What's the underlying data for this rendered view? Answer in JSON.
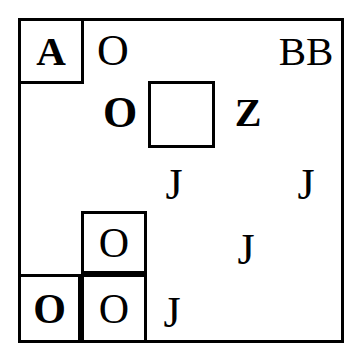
{
  "canvas": {
    "width": 362,
    "height": 362,
    "background": "#ffffff",
    "ink": "#000000"
  },
  "outer_frame": {
    "name": "outer-frame",
    "x": 18,
    "y": 18,
    "w": 326,
    "h": 325,
    "stroke": "#000000",
    "stroke_width": 3
  },
  "boxes": [
    {
      "name": "box-top-left-a",
      "x": 18,
      "y": 18,
      "w": 66,
      "h": 66
    },
    {
      "name": "box-center-empty",
      "x": 148,
      "y": 81,
      "w": 67,
      "h": 67
    },
    {
      "name": "box-lower-middle-o",
      "x": 81,
      "y": 211,
      "w": 66,
      "h": 63
    },
    {
      "name": "box-bottom-left-o",
      "x": 18,
      "y": 274,
      "w": 63,
      "h": 69
    },
    {
      "name": "box-bottom-middle-o",
      "x": 81,
      "y": 274,
      "w": 66,
      "h": 69
    }
  ],
  "glyphs": [
    {
      "name": "glyph-a-boxed",
      "text": "A",
      "x": 18,
      "y": 18,
      "w": 66,
      "h": 66,
      "size": 41,
      "weight": "bold"
    },
    {
      "name": "glyph-o-top",
      "text": "O",
      "x": 88,
      "y": 26,
      "w": 50,
      "h": 50,
      "size": 44,
      "weight": "regular"
    },
    {
      "name": "glyph-bb-top-right",
      "text": "BB",
      "x": 272,
      "y": 26,
      "w": 68,
      "h": 50,
      "size": 41,
      "weight": "regular"
    },
    {
      "name": "glyph-o-bold-middle",
      "text": "O",
      "x": 95,
      "y": 88,
      "w": 50,
      "h": 50,
      "size": 44,
      "weight": "bold"
    },
    {
      "name": "glyph-z-bold",
      "text": "Z",
      "x": 224,
      "y": 90,
      "w": 48,
      "h": 46,
      "size": 40,
      "weight": "bold"
    },
    {
      "name": "glyph-j-left",
      "text": "J",
      "x": 152,
      "y": 160,
      "w": 44,
      "h": 50,
      "size": 44,
      "weight": "regular"
    },
    {
      "name": "glyph-j-right",
      "text": "J",
      "x": 284,
      "y": 160,
      "w": 44,
      "h": 50,
      "size": 44,
      "weight": "regular"
    },
    {
      "name": "glyph-o-lower-boxed",
      "text": "O",
      "x": 81,
      "y": 211,
      "w": 66,
      "h": 63,
      "size": 42,
      "weight": "regular"
    },
    {
      "name": "glyph-j-middle",
      "text": "J",
      "x": 224,
      "y": 225,
      "w": 44,
      "h": 50,
      "size": 44,
      "weight": "regular"
    },
    {
      "name": "glyph-o-bottom-left",
      "text": "O",
      "x": 18,
      "y": 274,
      "w": 63,
      "h": 69,
      "size": 42,
      "weight": "bold"
    },
    {
      "name": "glyph-o-bottom-mid",
      "text": "O",
      "x": 81,
      "y": 274,
      "w": 66,
      "h": 69,
      "size": 42,
      "weight": "regular"
    },
    {
      "name": "glyph-j-bottom",
      "text": "J",
      "x": 150,
      "y": 288,
      "w": 44,
      "h": 50,
      "size": 44,
      "weight": "regular"
    }
  ]
}
